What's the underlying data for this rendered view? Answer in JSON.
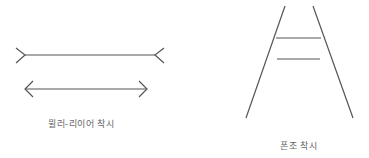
{
  "figures": [
    {
      "id": "muller-lyer",
      "label": "뮐러-리이어 착시"
    },
    {
      "id": "ponzo",
      "label": "폰조 착시"
    }
  ],
  "colors": {
    "line": "#555555",
    "text": "#666666"
  }
}
